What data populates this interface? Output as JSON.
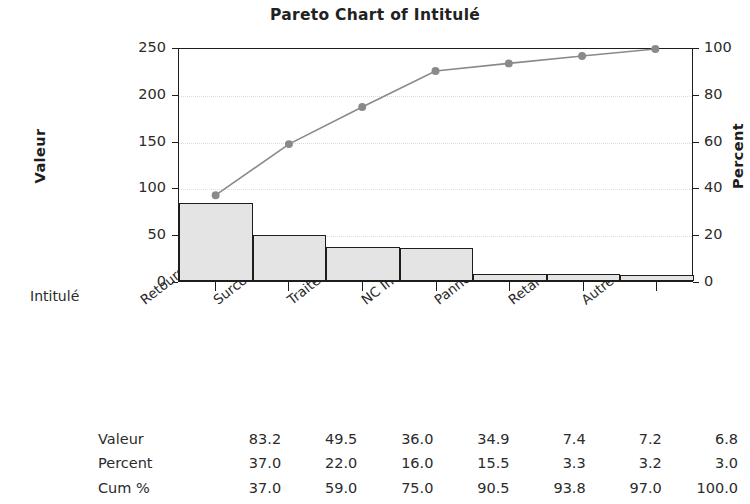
{
  "chart_data": {
    "type": "bar",
    "title": "Pareto Chart of Intitulé",
    "xlabel": "Intitulé",
    "ylabel": "Valeur",
    "ylabel_secondary": "Percent",
    "categories": [
      "Retours sous garantie",
      "Surconsommation",
      "Traitement des rejets",
      "NC Internes",
      "Pannes",
      "Retards",
      "Autre"
    ],
    "values": [
      83.2,
      49.5,
      36.0,
      34.9,
      7.4,
      7.2,
      6.8
    ],
    "percent": [
      37.0,
      22.0,
      16.0,
      15.5,
      3.3,
      3.2,
      3.0
    ],
    "cum_percent": [
      37.0,
      59.0,
      75.0,
      90.5,
      93.8,
      97.0,
      100.0
    ],
    "ylim": [
      0,
      250
    ],
    "ylim_secondary": [
      0,
      100
    ],
    "yticks": [
      0,
      50,
      100,
      150,
      200,
      250
    ],
    "yticks_secondary": [
      0,
      20,
      40,
      60,
      80,
      100
    ],
    "grid": true,
    "legend": "none",
    "series": [
      {
        "name": "Valeur",
        "type": "bar",
        "values": [
          83.2,
          49.5,
          36.0,
          34.9,
          7.4,
          7.2,
          6.8
        ]
      },
      {
        "name": "Cum %",
        "type": "line",
        "values": [
          37.0,
          59.0,
          75.0,
          90.5,
          93.8,
          97.0,
          100.0
        ]
      }
    ],
    "colors": {
      "bar_fill": "#e4e4e4",
      "bar_border": "#1d1d1d",
      "line": "#8a8a8a",
      "marker": "#8a8a8a",
      "axis": "#1d1d1d",
      "grid": "#dcdcdc",
      "background": "#ffffff",
      "text": "#2b2b2b"
    }
  },
  "table": {
    "rows": [
      {
        "label": "Valeur",
        "cells": [
          "83.2",
          "49.5",
          "36.0",
          "34.9",
          "7.4",
          "7.2",
          "6.8"
        ]
      },
      {
        "label": "Percent",
        "cells": [
          "37.0",
          "22.0",
          "16.0",
          "15.5",
          "3.3",
          "3.2",
          "3.0"
        ]
      },
      {
        "label": "Cum %",
        "cells": [
          "37.0",
          "59.0",
          "75.0",
          "90.5",
          "93.8",
          "97.0",
          "100.0"
        ]
      }
    ]
  },
  "axes": {
    "left_tick_labels": [
      "250",
      "200",
      "150",
      "100",
      "50",
      "0"
    ],
    "right_tick_labels": [
      "100",
      "80",
      "60",
      "40",
      "20",
      "0"
    ]
  }
}
